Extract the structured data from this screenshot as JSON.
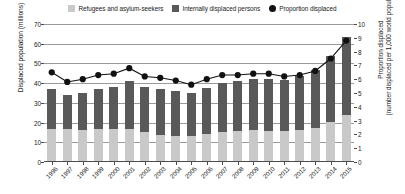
{
  "legend": {
    "items": [
      {
        "label": "Refugees and asylum-seekers",
        "color": "#c9c9c9",
        "marker": "square",
        "icon": "square-swatch-icon"
      },
      {
        "label": "Internally displaced persons",
        "color": "#595959",
        "marker": "square",
        "icon": "square-swatch-icon"
      },
      {
        "label": "Proportion displaced",
        "color": "#111111",
        "marker": "circle",
        "icon": "circle-marker-icon"
      }
    ]
  },
  "chart_data": {
    "type": "bar",
    "title": "",
    "xlabel": "",
    "ylabel": "Displaced population (millions)",
    "ylabel_right": "Proportion displaced",
    "ylabel_right_line2": "(number displaced per 1,000 world population)",
    "grid": true,
    "legend_position": "top-center",
    "ylim": [
      0,
      70
    ],
    "ylim_right": [
      0,
      10
    ],
    "yticks": [
      0,
      10,
      20,
      30,
      40,
      50,
      60,
      70
    ],
    "yticks_right": [
      0,
      1,
      2,
      3,
      4,
      5,
      6,
      7,
      8,
      9,
      10
    ],
    "categories": [
      "1996",
      "1997",
      "1998",
      "1999",
      "2000",
      "2001",
      "2002",
      "2003",
      "2004",
      "2005",
      "2006",
      "2007",
      "2008",
      "2009",
      "2010",
      "2011",
      "2012",
      "2013",
      "2014",
      "2015"
    ],
    "series": [
      {
        "name": "Refugees and asylum-seekers",
        "color": "#c9c9c9",
        "axis": "left",
        "stacked": true,
        "values": [
          17.0,
          16.5,
          16.0,
          16.5,
          17.0,
          16.5,
          15.0,
          13.5,
          13.0,
          13.0,
          14.0,
          15.0,
          15.5,
          16.0,
          15.5,
          15.5,
          16.0,
          17.5,
          20.5,
          24.0
        ]
      },
      {
        "name": "Internally displaced persons",
        "color": "#595959",
        "axis": "left",
        "stacked": true,
        "values": [
          20.0,
          17.5,
          19.0,
          20.5,
          21.0,
          24.5,
          23.0,
          23.5,
          23.0,
          22.0,
          23.5,
          25.0,
          25.5,
          26.0,
          26.5,
          26.0,
          27.5,
          29.0,
          33.5,
          39.5
        ]
      },
      {
        "name": "Total displaced population",
        "color": "#000000",
        "axis": "left",
        "derived": true,
        "values": [
          37.0,
          34.0,
          35.0,
          37.0,
          38.0,
          41.0,
          38.0,
          37.0,
          36.0,
          35.0,
          37.5,
          40.0,
          41.0,
          42.0,
          42.0,
          41.5,
          43.5,
          46.5,
          54.0,
          63.5
        ]
      },
      {
        "name": "Proportion displaced",
        "color": "#111111",
        "axis": "right",
        "marker": "circle",
        "values": [
          6.5,
          5.8,
          6.0,
          6.3,
          6.4,
          6.8,
          6.2,
          6.1,
          5.9,
          5.6,
          6.0,
          6.3,
          6.3,
          6.4,
          6.4,
          6.2,
          6.3,
          6.6,
          7.5,
          8.8
        ]
      }
    ]
  }
}
